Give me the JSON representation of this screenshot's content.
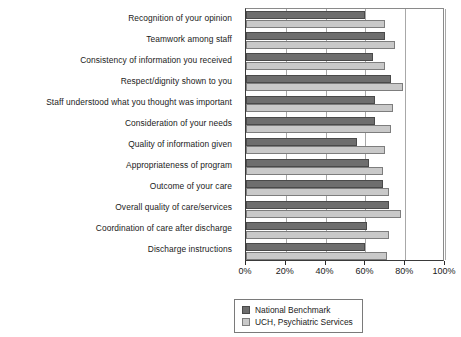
{
  "chart_data": {
    "type": "bar",
    "orientation": "horizontal",
    "title": "",
    "xlabel": "",
    "ylabel": "",
    "xlim": [
      0,
      100
    ],
    "xticks": [
      "0%",
      "20%",
      "40%",
      "60%",
      "80%",
      "100%"
    ],
    "xtick_values": [
      0,
      20,
      40,
      60,
      80,
      100
    ],
    "grid": true,
    "legend_position": "bottom-center",
    "categories": [
      "Recognition of your opinion",
      "Teamwork among staff",
      "Consistency of information you received",
      "Respect/dignity shown to you",
      "Staff understood what you thought was important",
      "Consideration of your needs",
      "Quality of information given",
      "Appropriateness of program",
      "Outcome of your care",
      "Overall quality of care/services",
      "Coordination of care after discharge",
      "Discharge instructions"
    ],
    "series": [
      {
        "name": "National Benchmark",
        "color": "#6e6e6e",
        "values": [
          60,
          70,
          64,
          73,
          65,
          65,
          56,
          62,
          69,
          72,
          61,
          60
        ]
      },
      {
        "name": "UCH, Psychiatric Services",
        "color": "#c9c9c9",
        "values": [
          70,
          75,
          70,
          79,
          74,
          73,
          70,
          69,
          72,
          78,
          72,
          71
        ]
      }
    ]
  },
  "legend": {
    "items": [
      {
        "label": "National Benchmark",
        "swatch": "benchmark"
      },
      {
        "label": "UCH, Psychiatric Services",
        "swatch": "uch"
      }
    ]
  }
}
